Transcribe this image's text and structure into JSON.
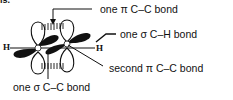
{
  "fragment": "is.",
  "labels": {
    "pi1": "one π  C–C bond",
    "sigma_ch": "one σ  C–H bond",
    "pi2": "second π  C–C bond",
    "sigma_cc": "one σ  C–C bond"
  },
  "atoms": {
    "h_left": "H",
    "h_right": "H",
    "c_left": "C",
    "c_right": "C"
  },
  "colors": {
    "ink": "#111111",
    "background": "#ffffff"
  }
}
